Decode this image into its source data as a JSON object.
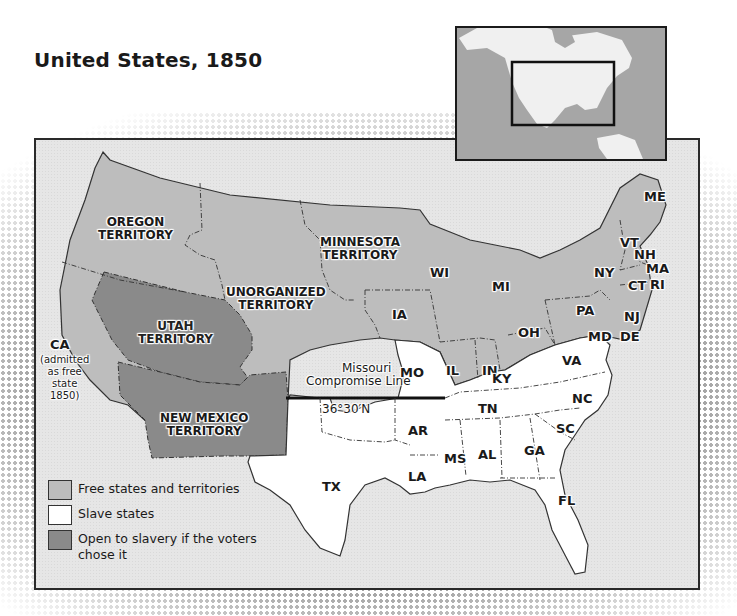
{
  "header": {
    "title": "United States, 1850"
  },
  "colors": {
    "free": "#bdbdbd",
    "slave": "#ffffff",
    "open_to_slavery": "#8a8a8a",
    "water": "#e6e6e6",
    "border": "#2a2a2a",
    "inset_land": "#f0f0f0",
    "inset_water": "#a6a6a6"
  },
  "inset_map": {
    "label": "North America locator map",
    "highlight": "United States region"
  },
  "territories": {
    "oregon": [
      "OREGON",
      "TERRITORY"
    ],
    "minnesota": [
      "MINNESOTA",
      "TERRITORY"
    ],
    "unorganized": [
      "UNORGANIZED",
      "TERRITORY"
    ],
    "utah": [
      "UTAH",
      "TERRITORY"
    ],
    "new_mexico": [
      "NEW MEXICO",
      "TERRITORY"
    ]
  },
  "california": {
    "abbr": "CA",
    "note": [
      "(admitted",
      "as free",
      "state",
      "1850)"
    ]
  },
  "states": {
    "free": [
      "ME",
      "VT",
      "NH",
      "MA",
      "RI",
      "CT",
      "NY",
      "NJ",
      "PA",
      "OH",
      "IN",
      "IL",
      "MI",
      "WI",
      "IA"
    ],
    "slave": [
      "MO",
      "KY",
      "VA",
      "MD",
      "DE",
      "NC",
      "SC",
      "GA",
      "FL",
      "AL",
      "MS",
      "LA",
      "AR",
      "TN",
      "TX"
    ]
  },
  "compromise_line": {
    "label_line1": "Missouri",
    "label_line2": "Compromise Line",
    "latitude": "36°30′N"
  },
  "legend": {
    "items": [
      {
        "label": "Free states and territories",
        "color": "#bdbdbd"
      },
      {
        "label": "Slave states",
        "color": "#ffffff"
      },
      {
        "label": "Open to slavery if the voters chose it",
        "color": "#8a8a8a"
      }
    ]
  }
}
